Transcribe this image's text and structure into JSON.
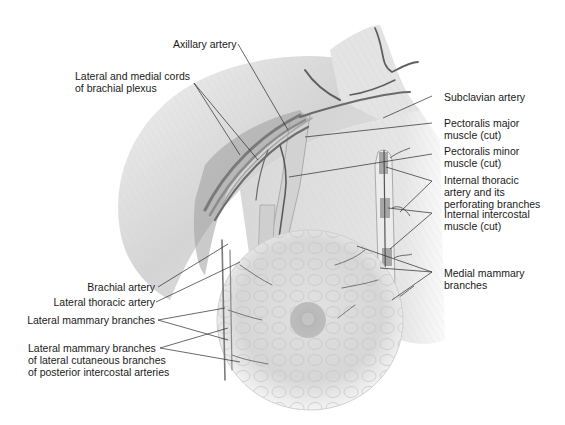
{
  "figure": {
    "type": "anatomical illustration",
    "colors": {
      "background": "#ffffff",
      "text": "#1a1a1a",
      "leader_line": "#2a2a2a",
      "tissue_light": "#e6e6e6",
      "tissue_mid": "#c8c8c8",
      "tissue_dark": "#8a8a8a",
      "vessel": "#5a5a5a",
      "areola": "#b0b0b0"
    }
  },
  "labels": {
    "axillary_artery": "Axillary artery",
    "brachial_plexus_cords": "Lateral and medial cords\nof brachial plexus",
    "subclavian_artery": "Subclavian artery",
    "pectoralis_major": "Pectoralis major\nmuscle (cut)",
    "pectoralis_minor": "Pectoralis minor\nmuscle (cut)",
    "internal_thoracic": "Internal thoracic\nartery and its\nperforating branches",
    "internal_intercostal": "Internal intercostal\nmuscle (cut)",
    "medial_mammary": "Medial mammary\nbranches",
    "brachial_artery": "Brachial artery",
    "lateral_thoracic": "Lateral thoracic artery",
    "lateral_mammary": "Lateral mammary branches",
    "lateral_mammary_cutaneous": "Lateral mammary branches\nof lateral cutaneous branches\nof posterior intercostal arteries"
  }
}
